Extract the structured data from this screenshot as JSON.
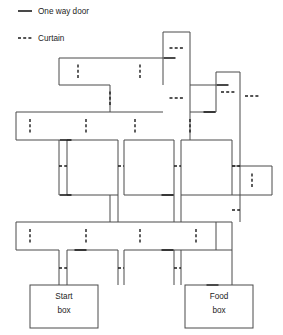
{
  "figure": {
    "width": 283,
    "height": 335,
    "background": "#ffffff",
    "wall_color": "#4a4a4a",
    "mark_color": "#1c1c1c"
  },
  "legend": {
    "title": "",
    "items": [
      {
        "id": "one-way-door",
        "label": "One way door",
        "style": "solid",
        "x": 38,
        "y": 14,
        "glyph_x1": 18,
        "glyph_x2": 32
      },
      {
        "id": "curtain",
        "label": "Curtain",
        "style": "dashed",
        "x": 38,
        "y": 41,
        "glyph_x1": 18,
        "glyph_x2": 32
      }
    ]
  },
  "boxes": [
    {
      "id": "start-box",
      "line1": "Start",
      "line2": "box",
      "x": 30,
      "y": 285,
      "w": 68,
      "h": 43,
      "cx": 64,
      "ty1": 299,
      "ty2": 313
    },
    {
      "id": "food-box",
      "line1": "Food",
      "line2": "box",
      "x": 185,
      "y": 285,
      "w": 68,
      "h": 43,
      "cx": 219,
      "ty1": 299,
      "ty2": 313
    }
  ],
  "walls": [
    [
      163,
      32,
      190,
      32
    ],
    [
      163,
      32,
      163,
      85
    ],
    [
      190,
      32,
      190,
      140
    ],
    [
      59,
      58,
      163,
      58
    ],
    [
      59,
      58,
      59,
      85
    ],
    [
      59,
      85,
      110,
      85
    ],
    [
      110,
      85,
      110,
      112
    ],
    [
      110,
      112,
      163,
      112
    ],
    [
      16,
      112,
      16,
      140
    ],
    [
      16,
      112,
      110,
      112
    ],
    [
      16,
      140,
      59,
      140
    ],
    [
      59,
      140,
      59,
      195
    ],
    [
      216,
      72,
      240,
      72
    ],
    [
      216,
      72,
      216,
      112
    ],
    [
      240,
      72,
      240,
      140
    ],
    [
      190,
      85,
      216,
      85
    ],
    [
      190,
      112,
      216,
      112
    ],
    [
      67,
      140,
      67,
      195
    ],
    [
      67,
      140,
      118,
      140
    ],
    [
      118,
      140,
      118,
      195
    ],
    [
      67,
      195,
      118,
      195
    ],
    [
      124,
      140,
      124,
      195
    ],
    [
      124,
      140,
      174,
      140
    ],
    [
      174,
      140,
      174,
      195
    ],
    [
      124,
      195,
      174,
      195
    ],
    [
      181,
      140,
      181,
      195
    ],
    [
      181,
      140,
      232,
      140
    ],
    [
      232,
      140,
      232,
      195
    ],
    [
      181,
      195,
      232,
      195
    ],
    [
      232,
      166,
      272,
      166
    ],
    [
      232,
      195,
      272,
      195
    ],
    [
      272,
      166,
      272,
      195
    ],
    [
      16,
      222,
      16,
      250
    ],
    [
      16,
      222,
      232,
      222
    ],
    [
      16,
      250,
      59,
      250
    ],
    [
      67,
      250,
      118,
      250
    ],
    [
      124,
      250,
      232,
      250
    ],
    [
      59,
      250,
      59,
      285
    ],
    [
      67,
      250,
      67,
      285
    ],
    [
      118,
      250,
      118,
      285
    ],
    [
      124,
      250,
      124,
      285
    ],
    [
      174,
      250,
      174,
      285
    ],
    [
      181,
      250,
      181,
      285
    ],
    [
      232,
      222,
      232,
      285
    ],
    [
      240,
      140,
      240,
      222
    ],
    [
      216,
      222,
      216,
      250
    ],
    [
      110,
      195,
      110,
      222
    ],
    [
      118,
      195,
      118,
      222
    ],
    [
      174,
      195,
      174,
      222
    ],
    [
      181,
      195,
      181,
      222
    ]
  ],
  "curtains": [
    {
      "o": "h",
      "x1": 163,
      "x2": 190,
      "y": 48
    },
    {
      "o": "h",
      "x1": 163,
      "x2": 190,
      "y": 98
    },
    {
      "o": "h",
      "x1": 216,
      "x2": 240,
      "y": 92
    },
    {
      "o": "h",
      "x1": 240,
      "x2": 264,
      "y": 96
    },
    {
      "o": "v",
      "y1": 58,
      "y2": 85,
      "x": 78
    },
    {
      "o": "v",
      "y1": 58,
      "y2": 85,
      "x": 140
    },
    {
      "o": "v",
      "y1": 85,
      "y2": 112,
      "x": 110
    },
    {
      "o": "v",
      "y1": 112,
      "y2": 140,
      "x": 30
    },
    {
      "o": "v",
      "y1": 112,
      "y2": 140,
      "x": 86
    },
    {
      "o": "v",
      "y1": 112,
      "y2": 140,
      "x": 135
    },
    {
      "o": "v",
      "y1": 112,
      "y2": 140,
      "x": 190
    },
    {
      "o": "h",
      "x1": 59,
      "x2": 67,
      "y": 166
    },
    {
      "o": "h",
      "x1": 118,
      "x2": 124,
      "y": 166
    },
    {
      "o": "h",
      "x1": 174,
      "x2": 181,
      "y": 166
    },
    {
      "o": "h",
      "x1": 232,
      "x2": 240,
      "y": 166
    },
    {
      "o": "v",
      "y1": 166,
      "y2": 195,
      "x": 252
    },
    {
      "o": "v",
      "y1": 222,
      "y2": 250,
      "x": 30
    },
    {
      "o": "v",
      "y1": 222,
      "y2": 250,
      "x": 86
    },
    {
      "o": "v",
      "y1": 222,
      "y2": 250,
      "x": 140
    },
    {
      "o": "v",
      "y1": 222,
      "y2": 250,
      "x": 196
    },
    {
      "o": "h",
      "x1": 59,
      "x2": 67,
      "y": 268
    },
    {
      "o": "h",
      "x1": 118,
      "x2": 124,
      "y": 268
    },
    {
      "o": "h",
      "x1": 174,
      "x2": 181,
      "y": 268
    },
    {
      "o": "h",
      "x1": 232,
      "x2": 240,
      "y": 210
    }
  ],
  "doors": [
    {
      "o": "h",
      "x1": 163,
      "x2": 176,
      "y": 58
    },
    {
      "o": "h",
      "x1": 59,
      "x2": 72,
      "y": 140
    },
    {
      "o": "h",
      "x1": 203,
      "x2": 216,
      "y": 112
    },
    {
      "o": "h",
      "x1": 216,
      "x2": 229,
      "y": 85
    },
    {
      "o": "h",
      "x1": 59,
      "x2": 72,
      "y": 195
    },
    {
      "o": "h",
      "x1": 161,
      "x2": 174,
      "y": 195
    },
    {
      "o": "h",
      "x1": 161,
      "x2": 174,
      "y": 250
    },
    {
      "o": "h",
      "x1": 206,
      "x2": 219,
      "y": 285
    },
    {
      "o": "h",
      "x1": 74,
      "x2": 87,
      "y": 250
    }
  ]
}
